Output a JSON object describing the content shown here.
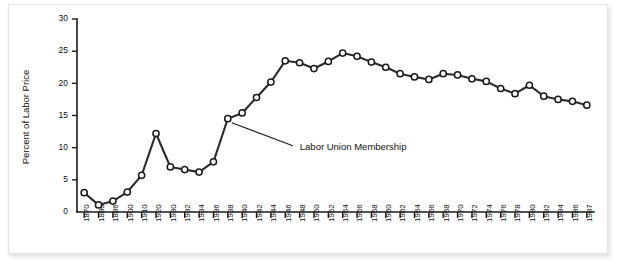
{
  "chart_data": {
    "type": "line",
    "title": "",
    "xlabel": "",
    "ylabel": "Percent of Labor Price",
    "ylim": [
      0,
      30
    ],
    "yticks": [
      0,
      5,
      10,
      15,
      20,
      25,
      30
    ],
    "ytick_labels": [
      "0",
      "5",
      "10",
      "15",
      "20",
      "25",
      "30"
    ],
    "grid": false,
    "legend": "none",
    "categories": [
      "1870",
      "1880",
      "1886",
      "1900",
      "1910",
      "1920",
      "1930",
      "1932",
      "1934",
      "1936",
      "1938",
      "1940",
      "1942",
      "1944",
      "1946",
      "1948",
      "1950",
      "1952",
      "1954",
      "1956",
      "1958",
      "1960",
      "1962",
      "1964",
      "1966",
      "1968",
      "1970",
      "1972",
      "1974",
      "1976",
      "1978",
      "1980",
      "1982",
      "1984",
      "1986",
      "1987"
    ],
    "series": [
      {
        "name": "Labor Union Membership",
        "values": [
          3.0,
          1.1,
          1.7,
          3.1,
          5.7,
          12.2,
          7.0,
          6.6,
          6.2,
          7.8,
          14.5,
          15.4,
          17.8,
          20.2,
          23.5,
          23.2,
          22.3,
          23.4,
          24.7,
          24.2,
          23.3,
          22.5,
          21.5,
          21.0,
          20.6,
          21.5,
          21.3,
          20.7,
          20.3,
          19.2,
          18.4,
          19.7,
          18.0,
          17.5,
          17.2,
          16.6
        ]
      }
    ],
    "annotations": [
      {
        "text": "Labor Union Membership",
        "points_to_category": "1938",
        "points_to_value": 14.5
      }
    ]
  },
  "colors": {
    "line": "#2b2b2b",
    "marker_fill": "#ffffff",
    "marker_stroke": "#1a1a1a",
    "axis": "#1a1a1a",
    "panel_background": "#ffffff",
    "page_background": "#ffffff"
  }
}
